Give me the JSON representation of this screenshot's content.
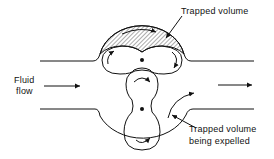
{
  "diagram": {
    "labels": {
      "trapped_volume": "Trapped volume",
      "fluid_flow_line1": "Fluid",
      "fluid_flow_line2": "flow",
      "expelled_line1": "Trapped volume",
      "expelled_line2": "being expelled"
    },
    "colors": {
      "stroke": "#111111",
      "background": "#ffffff"
    }
  }
}
